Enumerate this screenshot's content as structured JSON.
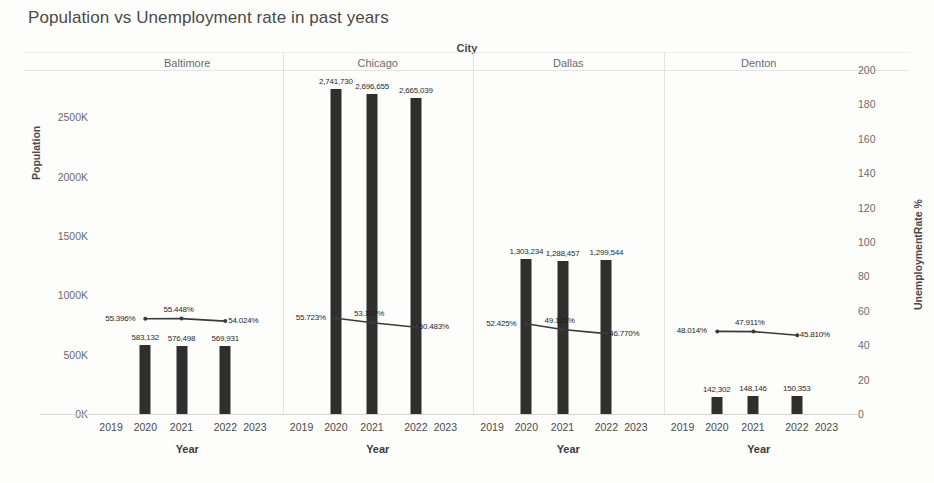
{
  "chart_data": {
    "type": "bar",
    "title": "Population vs Unemployment rate in past years",
    "xlabel": "Year",
    "ylabel": "Population",
    "y2label": "UnemploymentRate %",
    "panel_field": "City",
    "grid": false,
    "legend": "none",
    "ylim": [
      0,
      2900000
    ],
    "y2lim": [
      0,
      200
    ],
    "yticks": [
      "0K",
      "500K",
      "1000K",
      "1500K",
      "2000K",
      "2500K"
    ],
    "ytick_values": [
      0,
      500000,
      1000000,
      1500000,
      2000000,
      2500000
    ],
    "y2ticks": [
      "0",
      "20",
      "40",
      "60",
      "80",
      "100",
      "120",
      "140",
      "160",
      "180",
      "200"
    ],
    "y2tick_values": [
      0,
      20,
      40,
      60,
      80,
      100,
      120,
      140,
      160,
      180,
      200
    ],
    "xticks": [
      "2019",
      "2020",
      "2021",
      "2022",
      "2023"
    ],
    "x": [
      2020,
      2021,
      2022
    ],
    "panels": [
      {
        "name": "Baltimore",
        "bar_series": {
          "name": "Population",
          "values": [
            583132,
            576498,
            569931
          ],
          "labels": [
            "583,132",
            "576,498",
            "569,931"
          ]
        },
        "line_series": {
          "name": "UnemploymentRate %",
          "values": [
            55.396,
            55.448,
            54.024
          ],
          "labels": [
            "55.396%",
            "55.448%",
            "54.024%"
          ]
        }
      },
      {
        "name": "Chicago",
        "bar_series": {
          "name": "Population",
          "values": [
            2741730,
            2696655,
            2665039
          ],
          "labels": [
            "2,741,730",
            "2,696,655",
            "2,665,039"
          ]
        },
        "line_series": {
          "name": "UnemploymentRate %",
          "values": [
            55.723,
            53.102,
            50.483
          ],
          "labels": [
            "55.723%",
            "53.102%",
            "50.483%"
          ]
        }
      },
      {
        "name": "Dallas",
        "bar_series": {
          "name": "Population",
          "values": [
            1303234,
            1288457,
            1299544
          ],
          "labels": [
            "1,303,234",
            "1,288,457",
            "1,299,544"
          ]
        },
        "line_series": {
          "name": "UnemploymentRate %",
          "values": [
            52.425,
            49.125,
            46.77
          ],
          "labels": [
            "52.425%",
            "49.125%",
            "46.770%"
          ]
        }
      },
      {
        "name": "Denton",
        "bar_series": {
          "name": "Population",
          "values": [
            142302,
            148146,
            150353
          ],
          "labels": [
            "142,302",
            "148,146",
            "150,353"
          ]
        },
        "line_series": {
          "name": "UnemploymentRate %",
          "values": [
            48.014,
            47.911,
            45.81
          ],
          "labels": [
            "48.014%",
            "47.911%",
            "45.810%"
          ]
        }
      }
    ],
    "colors": {
      "bar": "#2f2f2f",
      "line": "#3a3a3a",
      "text": "#4a4a4a",
      "panel_header_text": "#6b6b6b",
      "background": "#fdfdfc",
      "divider": "#e2e2e2"
    }
  }
}
